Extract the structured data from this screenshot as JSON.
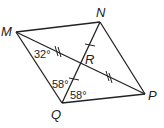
{
  "figure": {
    "type": "quadrilateral-with-diagonals",
    "vertices": {
      "M": {
        "label": "M",
        "x": 16,
        "y": 32
      },
      "N": {
        "label": "N",
        "x": 100,
        "y": 22
      },
      "P": {
        "label": "P",
        "x": 145,
        "y": 94
      },
      "Q": {
        "label": "Q",
        "x": 62,
        "y": 103
      }
    },
    "intersection": {
      "label": "R",
      "x": 81,
      "y": 62
    },
    "angles": [
      {
        "id": "angle-m",
        "text": "32°"
      },
      {
        "id": "angle-q-upper",
        "text": "58°"
      },
      {
        "id": "angle-q-lower",
        "text": "58°"
      }
    ],
    "congruence_marks": {
      "MR_RP": "double-tick",
      "NR_RQ": "single-tick"
    }
  }
}
